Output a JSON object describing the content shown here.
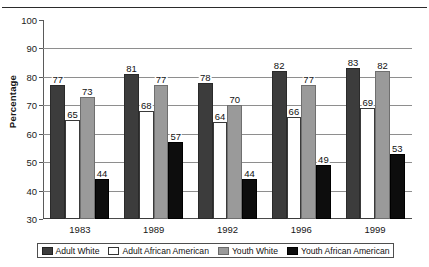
{
  "chart_data": {
    "type": "bar",
    "title": "",
    "xlabel": "",
    "ylabel": "Percentage",
    "ylim": [
      30,
      100
    ],
    "ytick_step": 10,
    "yticks": [
      30,
      40,
      50,
      60,
      70,
      80,
      90,
      100
    ],
    "grid": true,
    "legend_position": "bottom",
    "categories": [
      "1983",
      "1989",
      "1992",
      "1996",
      "1999"
    ],
    "series": [
      {
        "name": "Adult White",
        "color": "#3c3c3c",
        "values": [
          77,
          81,
          78,
          82,
          83
        ]
      },
      {
        "name": "Adult African American",
        "color": "#ffffff",
        "values": [
          65,
          68,
          64,
          66,
          69
        ]
      },
      {
        "name": "Youth White",
        "color": "#9a9a9a",
        "values": [
          73,
          77,
          70,
          77,
          82
        ]
      },
      {
        "name": "Youth African American",
        "color": "#0d0d0d",
        "values": [
          44,
          57,
          44,
          49,
          53
        ]
      }
    ],
    "data_labels": true
  },
  "legend": {
    "items": [
      {
        "label": "Adult White"
      },
      {
        "label": "Adult African American"
      },
      {
        "label": "Youth White"
      },
      {
        "label": "Youth African American"
      }
    ]
  }
}
